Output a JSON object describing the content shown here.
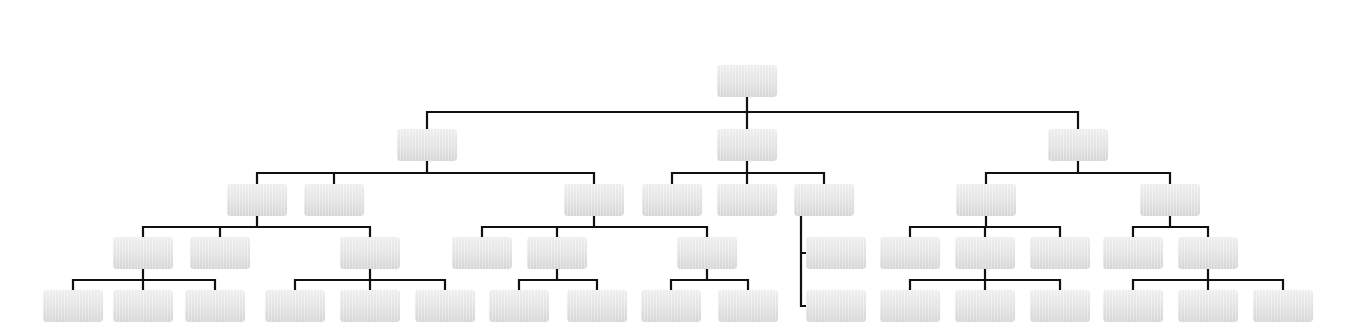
{
  "diagram": {
    "type": "org-chart",
    "node_size": {
      "w": 60,
      "h": 32
    },
    "colors": {
      "line": "#111111",
      "node_top": "#f3f3f3",
      "node_bottom": "#dadada",
      "background": "#ffffff"
    },
    "nodes": [
      {
        "id": "root",
        "label": "",
        "x": 717,
        "y": 65
      },
      {
        "id": "L1a",
        "label": "",
        "x": 397,
        "y": 129,
        "parent": "root"
      },
      {
        "id": "L1b",
        "label": "",
        "x": 717,
        "y": 129,
        "parent": "root"
      },
      {
        "id": "L1c",
        "label": "",
        "x": 1048,
        "y": 129,
        "parent": "root"
      },
      {
        "id": "L2a",
        "label": "",
        "x": 227,
        "y": 184,
        "parent": "L1a"
      },
      {
        "id": "L2b",
        "label": "",
        "x": 304,
        "y": 184,
        "parent": "L1a"
      },
      {
        "id": "L2c",
        "label": "",
        "x": 564,
        "y": 184,
        "parent": "L1a"
      },
      {
        "id": "L2d",
        "label": "",
        "x": 642,
        "y": 184,
        "parent": "L1b"
      },
      {
        "id": "L2e",
        "label": "",
        "x": 717,
        "y": 184,
        "parent": "L1b"
      },
      {
        "id": "L2f",
        "label": "",
        "x": 794,
        "y": 184,
        "parent": "L1b"
      },
      {
        "id": "L2g",
        "label": "",
        "x": 956,
        "y": 184,
        "parent": "L1c"
      },
      {
        "id": "L2h",
        "label": "",
        "x": 1140,
        "y": 184,
        "parent": "L1c"
      },
      {
        "id": "L3a",
        "label": "",
        "x": 113,
        "y": 237,
        "parent": "L2a"
      },
      {
        "id": "L3b",
        "label": "",
        "x": 190,
        "y": 237,
        "parent": "L2a"
      },
      {
        "id": "L3c",
        "label": "",
        "x": 340,
        "y": 237,
        "parent": "L2a"
      },
      {
        "id": "L3d",
        "label": "",
        "x": 452,
        "y": 237,
        "parent": "L2c"
      },
      {
        "id": "L3e",
        "label": "",
        "x": 527,
        "y": 237,
        "parent": "L2c"
      },
      {
        "id": "L3f",
        "label": "",
        "x": 677,
        "y": 237,
        "parent": "L2c"
      },
      {
        "id": "L3g",
        "label": "",
        "x": 806,
        "y": 237,
        "parent": "L2f",
        "side": true
      },
      {
        "id": "L3h",
        "label": "",
        "x": 880,
        "y": 237,
        "parent": "L2g"
      },
      {
        "id": "L3i",
        "label": "",
        "x": 955,
        "y": 237,
        "parent": "L2g"
      },
      {
        "id": "L3j",
        "label": "",
        "x": 1030,
        "y": 237,
        "parent": "L2g"
      },
      {
        "id": "L3k",
        "label": "",
        "x": 1103,
        "y": 237,
        "parent": "L2h"
      },
      {
        "id": "L3l",
        "label": "",
        "x": 1178,
        "y": 237,
        "parent": "L2h"
      },
      {
        "id": "L4a",
        "label": "",
        "x": 43,
        "y": 290,
        "parent": "L3a"
      },
      {
        "id": "L4b",
        "label": "",
        "x": 113,
        "y": 290,
        "parent": "L3a"
      },
      {
        "id": "L4c",
        "label": "",
        "x": 185,
        "y": 290,
        "parent": "L3a"
      },
      {
        "id": "L4d",
        "label": "",
        "x": 265,
        "y": 290,
        "parent": "L3c"
      },
      {
        "id": "L4e",
        "label": "",
        "x": 340,
        "y": 290,
        "parent": "L3c"
      },
      {
        "id": "L4f",
        "label": "",
        "x": 415,
        "y": 290,
        "parent": "L3c"
      },
      {
        "id": "L4g",
        "label": "",
        "x": 489,
        "y": 290,
        "parent": "L3e"
      },
      {
        "id": "L4h",
        "label": "",
        "x": 567,
        "y": 290,
        "parent": "L3e"
      },
      {
        "id": "L4i",
        "label": "",
        "x": 641,
        "y": 290,
        "parent": "L3f"
      },
      {
        "id": "L4j",
        "label": "",
        "x": 718,
        "y": 290,
        "parent": "L3f"
      },
      {
        "id": "L4k",
        "label": "",
        "x": 806,
        "y": 290,
        "parent": "L2f",
        "side": true
      },
      {
        "id": "L4l",
        "label": "",
        "x": 880,
        "y": 290,
        "parent": "L3i"
      },
      {
        "id": "L4m",
        "label": "",
        "x": 955,
        "y": 290,
        "parent": "L3i"
      },
      {
        "id": "L4n",
        "label": "",
        "x": 1030,
        "y": 290,
        "parent": "L3i"
      },
      {
        "id": "L4o",
        "label": "",
        "x": 1103,
        "y": 290,
        "parent": "L3l"
      },
      {
        "id": "L4p",
        "label": "",
        "x": 1178,
        "y": 290,
        "parent": "L3l"
      },
      {
        "id": "L4q",
        "label": "",
        "x": 1253,
        "y": 290,
        "parent": "L3l"
      }
    ],
    "side_branch": {
      "parent": "L2f",
      "trunk_x": 801
    }
  }
}
